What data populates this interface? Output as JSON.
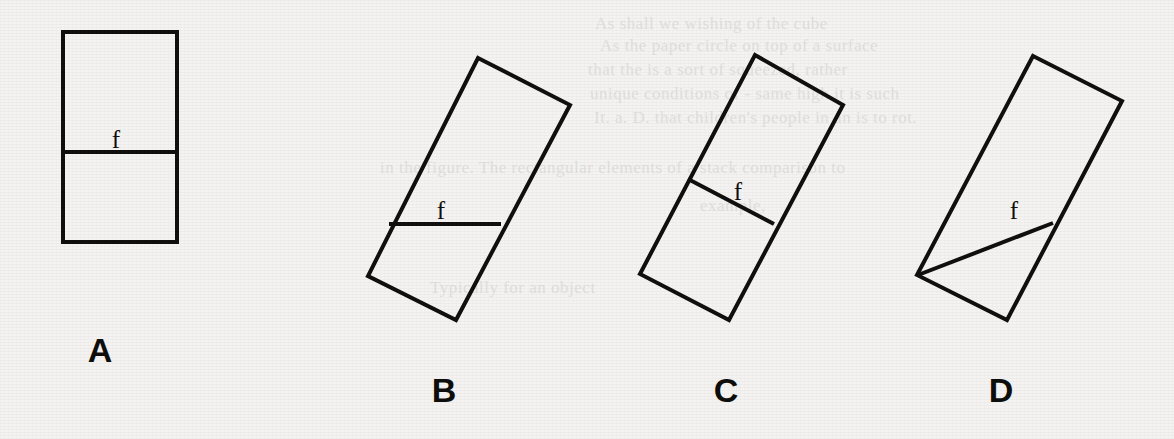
{
  "figure": {
    "canvas": {
      "width": 1174,
      "height": 439
    },
    "background_color": "#f4f3f1",
    "ink_color": "#100f0e",
    "stroke_width": 4,
    "caption_letter_size": 34,
    "segment_label_size": 25
  },
  "background_ghost_text": [
    {
      "text": "As shall we wishing of the cube",
      "x": 595,
      "y": 14,
      "size": 17
    },
    {
      "text": "As the paper circle on top of a surface",
      "x": 600,
      "y": 36,
      "size": 17
    },
    {
      "text": "that the is a sort of squeezed, rather",
      "x": 588,
      "y": 60,
      "size": 17
    },
    {
      "text": "unique conditions of - same high it is such",
      "x": 590,
      "y": 84,
      "size": 17
    },
    {
      "text": "It. a. D. that children's people in an is to rot.",
      "x": 594,
      "y": 108,
      "size": 17
    },
    {
      "text": "in the figure. The rectangular elements of a stack comparison to",
      "x": 380,
      "y": 158,
      "size": 17
    },
    {
      "text": "example,",
      "x": 700,
      "y": 196,
      "size": 17
    },
    {
      "text": "Typically for an object",
      "x": 430,
      "y": 278,
      "size": 17
    }
  ],
  "panels": [
    {
      "id": "A",
      "letter": "A",
      "letter_position": {
        "x": 100,
        "y": 362
      },
      "shape": {
        "kind": "rectangle-upright",
        "corners": [
          [
            63,
            32
          ],
          [
            177,
            32
          ],
          [
            177,
            242
          ],
          [
            63,
            242
          ]
        ]
      },
      "segment": {
        "name": "fold-line",
        "from": [
          63,
          152
        ],
        "to": [
          177,
          152
        ],
        "orientation": "horizontal"
      },
      "segment_label": {
        "text": "f",
        "x": 116,
        "y": 148
      },
      "description": "upright rectangle split by a horizontal line into two equal halves"
    },
    {
      "id": "B",
      "letter": "B",
      "letter_position": {
        "x": 444,
        "y": 402
      },
      "shape": {
        "kind": "rectangle-rotated",
        "corners": [
          [
            478,
            58
          ],
          [
            570,
            105
          ],
          [
            456,
            320
          ],
          [
            368,
            276
          ]
        ]
      },
      "segment": {
        "name": "fold-line",
        "from": [
          389,
          224
        ],
        "to": [
          501,
          224
        ],
        "orientation": "horizontal"
      },
      "segment_label": {
        "text": "f",
        "x": 441,
        "y": 219
      },
      "description": "tilted rectangle crossed by a truly horizontal line"
    },
    {
      "id": "C",
      "letter": "C",
      "letter_position": {
        "x": 726,
        "y": 402
      },
      "shape": {
        "kind": "rectangle-rotated",
        "corners": [
          [
            755,
            55
          ],
          [
            843,
            105
          ],
          [
            729,
            320
          ],
          [
            640,
            274
          ]
        ]
      },
      "segment": {
        "name": "fold-line",
        "from": [
          688,
          179
        ],
        "to": [
          774,
          224
        ],
        "orientation": "parallel-to-short-side"
      },
      "segment_label": {
        "text": "f",
        "x": 738,
        "y": 200
      },
      "description": "tilted rectangle split by a line parallel to its short sides"
    },
    {
      "id": "D",
      "letter": "D",
      "letter_position": {
        "x": 1001,
        "y": 402
      },
      "shape": {
        "kind": "rectangle-rotated",
        "corners": [
          [
            1033,
            56
          ],
          [
            1122,
            101
          ],
          [
            1007,
            320
          ],
          [
            917,
            275
          ]
        ]
      },
      "segment": {
        "name": "fold-line",
        "from": [
          918,
          275
        ],
        "to": [
          1053,
          223
        ],
        "orientation": "diagonal-from-bottom-left-corner"
      },
      "segment_label": {
        "text": "f",
        "x": 1014,
        "y": 219
      },
      "description": "tilted rectangle with a diagonal line from the bottom-left corner to the right edge"
    }
  ]
}
